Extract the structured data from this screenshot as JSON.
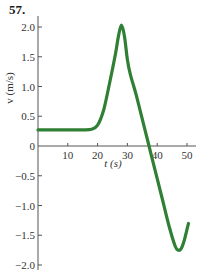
{
  "problem": {
    "number": "57."
  },
  "chart_data": {
    "type": "line",
    "title": "",
    "xlabel": "t (s)",
    "ylabel": "v (m/s)",
    "xlim": [
      0,
      52
    ],
    "ylim": [
      -2.1,
      2.1
    ],
    "grid": false,
    "legend": null,
    "x_ticks": [
      10,
      20,
      30,
      40,
      50
    ],
    "x_tick_labels": [
      "10",
      "20",
      "30",
      "40",
      "50"
    ],
    "y_ticks": [
      2.0,
      1.5,
      1.0,
      0.5,
      0,
      -0.5,
      -1.0,
      -1.5,
      -2.0
    ],
    "y_tick_labels": [
      "2.0",
      "1.5",
      "1.0",
      "0.5",
      "0",
      "−0.5",
      "−1.0",
      "−1.5",
      "−2.0"
    ],
    "series": [
      {
        "name": "v(t)",
        "color": "#2f7f34",
        "x": [
          0,
          5,
          10,
          15,
          18,
          20,
          22,
          24,
          26,
          27,
          28,
          29,
          30,
          31,
          33,
          35,
          37,
          38,
          40,
          42,
          44,
          46,
          47,
          48,
          49,
          50,
          50.5
        ],
        "y": [
          0.27,
          0.27,
          0.27,
          0.27,
          0.28,
          0.35,
          0.6,
          1.05,
          1.55,
          1.85,
          2.03,
          1.85,
          1.45,
          1.2,
          0.85,
          0.45,
          0.05,
          -0.15,
          -0.55,
          -0.95,
          -1.35,
          -1.68,
          -1.75,
          -1.73,
          -1.6,
          -1.4,
          -1.3
        ]
      }
    ]
  }
}
